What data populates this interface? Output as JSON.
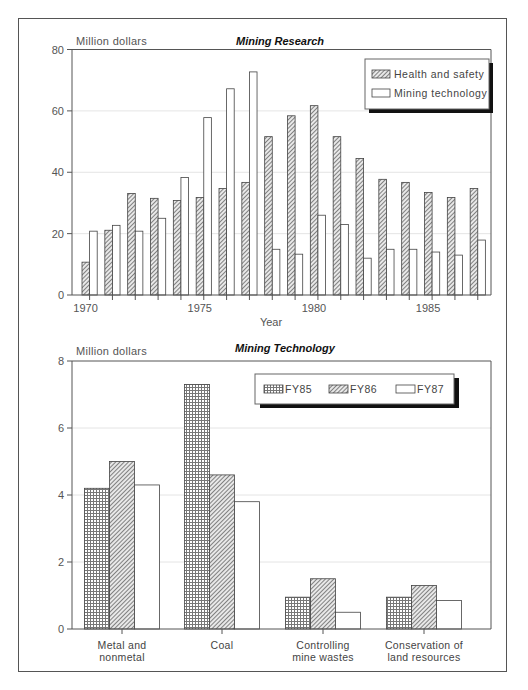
{
  "chart_data": [
    {
      "type": "bar",
      "title": "Mining Research",
      "ylabel": "Million dollars",
      "xlabel": "Year",
      "ylim": [
        0,
        80
      ],
      "yticks": [
        0,
        20,
        40,
        60,
        80
      ],
      "xtick_labels": [
        "1970",
        "1975",
        "1980",
        "1985"
      ],
      "grid": true,
      "legend_position": "upper right",
      "categories": [
        "1970",
        "1971",
        "1972",
        "1973",
        "1974",
        "1975",
        "1976",
        "1977",
        "1978",
        "1979",
        "1980",
        "1981",
        "1982",
        "1983",
        "1984",
        "1985",
        "1986",
        "1987"
      ],
      "series": [
        {
          "name": "Health and safety",
          "pattern": "diagonal-hatch",
          "values": [
            10.7,
            21.1,
            33.1,
            31.5,
            30.8,
            31.8,
            34.7,
            36.7,
            51.6,
            58.4,
            61.7,
            51.6,
            44.5,
            37.7,
            36.7,
            33.4,
            31.8,
            34.7
          ]
        },
        {
          "name": "Mining technology",
          "pattern": "open",
          "values": [
            20.8,
            22.7,
            20.8,
            25.0,
            38.3,
            57.8,
            67.2,
            72.7,
            14.9,
            13.3,
            26.0,
            23.0,
            12.0,
            14.9,
            14.9,
            14.0,
            13.0,
            17.9
          ]
        }
      ]
    },
    {
      "type": "bar",
      "title": "Mining Technology",
      "ylabel": "Million dollars",
      "xlabel": "",
      "ylim": [
        0,
        8
      ],
      "yticks": [
        0,
        2,
        4,
        6,
        8
      ],
      "grid": true,
      "legend_position": "upper right",
      "categories": [
        "Metal and nonmetal",
        "Coal",
        "Controlling mine wastes",
        "Conservation of land resources"
      ],
      "category_lines": [
        [
          "Metal and",
          "nonmetal"
        ],
        [
          "Coal"
        ],
        [
          "Controlling",
          "mine wastes"
        ],
        [
          "Conservation of",
          "land resources"
        ]
      ],
      "series": [
        {
          "name": "FY85",
          "pattern": "dot-grid",
          "values": [
            4.2,
            7.3,
            0.95,
            0.95
          ]
        },
        {
          "name": "FY86",
          "pattern": "diagonal-hatch",
          "values": [
            5.0,
            4.6,
            1.5,
            1.3
          ]
        },
        {
          "name": "FY87",
          "pattern": "open",
          "values": [
            4.3,
            3.8,
            0.5,
            0.85
          ]
        }
      ]
    }
  ],
  "colors": {
    "axis": "#555555",
    "grid": "#dddddd",
    "bar_stroke": "#444444",
    "legend_shadow": "#111111"
  }
}
